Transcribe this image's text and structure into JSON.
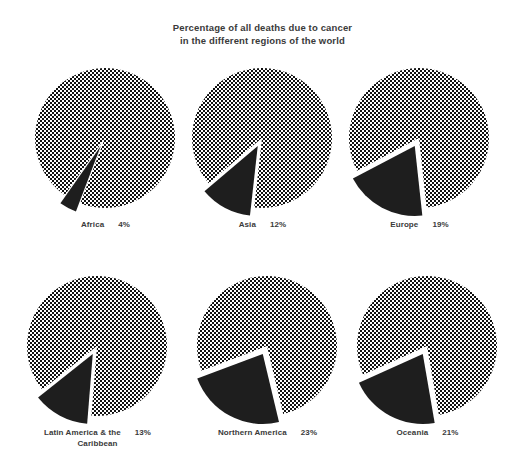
{
  "chart_data": {
    "type": "pie",
    "title": "Percentage of all deaths due to cancer\nin the different regions of the world",
    "xlabel": "",
    "ylabel": "",
    "legend": "none",
    "grid": false,
    "units": "percent",
    "slice_labels": [
      "Deaths due to cancer",
      "All other deaths"
    ],
    "colors": {
      "cancer_slice": "#1e1e1e",
      "other_slice": "#9a9a9a",
      "background": "#ffffff",
      "text": "#3a3a3a"
    },
    "panels": [
      {
        "id": "africa",
        "region": "Africa",
        "value": 4,
        "value_label": "4%",
        "remainder": 96,
        "caption_line2": ""
      },
      {
        "id": "asia",
        "region": "Asia",
        "value": 12,
        "value_label": "12%",
        "remainder": 88,
        "caption_line2": ""
      },
      {
        "id": "europe",
        "region": "Europe",
        "value": 19,
        "value_label": "19%",
        "remainder": 81,
        "caption_line2": ""
      },
      {
        "id": "latin-america",
        "region": "Latin America & the",
        "value": 13,
        "value_label": "13%",
        "remainder": 87,
        "caption_line2": "Caribbean"
      },
      {
        "id": "northern-america",
        "region": "Northern America",
        "value": 23,
        "value_label": "23%",
        "remainder": 77,
        "caption_line2": ""
      },
      {
        "id": "oceania",
        "region": "Oceania",
        "value": 21,
        "value_label": "21%",
        "remainder": 79,
        "caption_line2": ""
      }
    ]
  }
}
